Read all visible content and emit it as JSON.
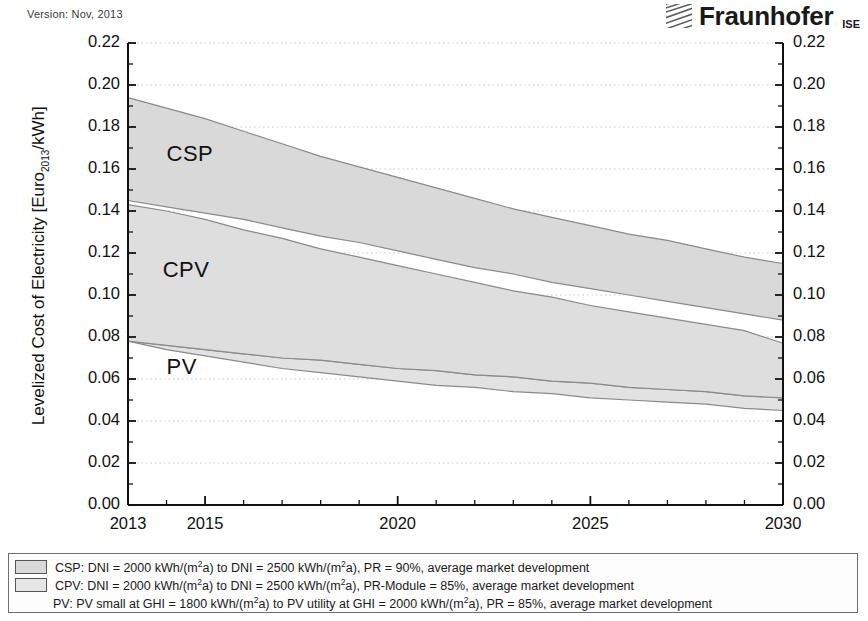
{
  "header": {
    "version": "Version: Nov, 2013",
    "logo_word": "Fraunhofer",
    "logo_sub": "ISE",
    "logo_icon": "fraunhofer-hatch-logo"
  },
  "chart_data": {
    "type": "area",
    "title": "",
    "xlabel": "",
    "ylabel": "Levelized Cost of Electricity [Euro2013/kWh]",
    "ylabel_prefix": "Levelized Cost of Electricity [Euro",
    "ylabel_sub": "2013",
    "ylabel_suffix": "/kWh]",
    "xlim": [
      2013,
      2030
    ],
    "ylim": [
      0.0,
      0.22
    ],
    "ytick_step": 0.02,
    "yminor_step": 0.01,
    "grid": "dotted-major-y",
    "legend_position": "below-plot",
    "xticks": [
      2013,
      2015,
      2020,
      2025,
      2030
    ],
    "xtick_labels": [
      "2013",
      "2015",
      "2020",
      "2025",
      "2030"
    ],
    "yticks": [
      0.0,
      0.02,
      0.04,
      0.06,
      0.08,
      0.1,
      0.12,
      0.14,
      0.16,
      0.18,
      0.2,
      0.22
    ],
    "ytick_labels": [
      "0.00",
      "0.02",
      "0.04",
      "0.06",
      "0.08",
      "0.10",
      "0.12",
      "0.14",
      "0.16",
      "0.18",
      "0.20",
      "0.22"
    ],
    "x": [
      2013,
      2014,
      2015,
      2016,
      2017,
      2018,
      2019,
      2020,
      2021,
      2022,
      2023,
      2024,
      2025,
      2026,
      2027,
      2028,
      2029,
      2030
    ],
    "series": [
      {
        "name": "CSP",
        "fill": "#d9d9d9",
        "upper": [
          0.194,
          0.189,
          0.184,
          0.178,
          0.172,
          0.166,
          0.161,
          0.156,
          0.151,
          0.146,
          0.141,
          0.137,
          0.133,
          0.129,
          0.126,
          0.122,
          0.118,
          0.115
        ],
        "lower": [
          0.145,
          0.142,
          0.139,
          0.136,
          0.132,
          0.128,
          0.125,
          0.121,
          0.117,
          0.113,
          0.11,
          0.106,
          0.103,
          0.1,
          0.097,
          0.094,
          0.091,
          0.088
        ]
      },
      {
        "name": "CPV",
        "fill": "#dedede",
        "upper": [
          0.143,
          0.14,
          0.136,
          0.131,
          0.127,
          0.122,
          0.118,
          0.114,
          0.11,
          0.106,
          0.102,
          0.099,
          0.095,
          0.092,
          0.089,
          0.086,
          0.083,
          0.077
        ],
        "lower": [
          0.078,
          0.076,
          0.074,
          0.072,
          0.07,
          0.069,
          0.067,
          0.065,
          0.064,
          0.062,
          0.061,
          0.059,
          0.058,
          0.056,
          0.055,
          0.054,
          0.052,
          0.051
        ]
      },
      {
        "name": "PV",
        "fill": "#e2e2e2",
        "upper": [
          0.078,
          0.076,
          0.074,
          0.072,
          0.07,
          0.069,
          0.067,
          0.065,
          0.064,
          0.062,
          0.061,
          0.059,
          0.058,
          0.056,
          0.055,
          0.054,
          0.052,
          0.051
        ],
        "lower": [
          0.078,
          0.074,
          0.071,
          0.068,
          0.065,
          0.063,
          0.061,
          0.059,
          0.057,
          0.056,
          0.054,
          0.053,
          0.051,
          0.05,
          0.049,
          0.048,
          0.046,
          0.045
        ]
      }
    ],
    "band_labels": [
      {
        "text": "CSP",
        "x": 2014.0,
        "y": 0.166
      },
      {
        "text": "CPV",
        "x": 2013.9,
        "y": 0.111
      },
      {
        "text": "PV",
        "x": 2014.0,
        "y": 0.065
      }
    ],
    "annotations": []
  },
  "legend": {
    "rows": [
      {
        "swatch": "#d9d9d9",
        "has_swatch": true,
        "a": "CSP: DNI = 2000 kWh/(m",
        "sup": "2",
        "b": "a) to DNI = 2500 kWh/(m",
        "sup2": "2",
        "c": "a), PR = 90%, average market development"
      },
      {
        "swatch": "#e6e6e6",
        "has_swatch": true,
        "a": "CPV: DNI = 2000 kWh/(m",
        "sup": "2",
        "b": "a) to DNI = 2500 kWh/(m",
        "sup2": "2",
        "c": "a), PR-Module = 85%, average market development"
      },
      {
        "swatch": "",
        "has_swatch": false,
        "a": "PV: PV small at GHI = 1800 kWh/(m",
        "sup": "2",
        "b": "a) to PV utility at GHI = 2000 kWh/(m",
        "sup2": "2",
        "c": "a), PR = 85%, average market development"
      }
    ]
  }
}
